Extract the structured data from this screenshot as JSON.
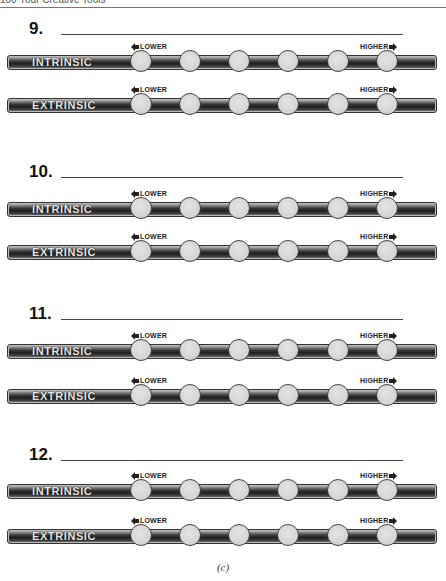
{
  "page": {
    "running_head": "100   Your Creative Tools",
    "caption": "(c)"
  },
  "scale_labels": {
    "lower": "LOWER",
    "higher": "HIGHER"
  },
  "items": [
    {
      "number": "9.",
      "scales": [
        {
          "label": "INTRINSIC",
          "points": 6
        },
        {
          "label": "EXTRINSIC",
          "points": 6
        }
      ]
    },
    {
      "number": "10.",
      "scales": [
        {
          "label": "INTRINSIC",
          "points": 6
        },
        {
          "label": "EXTRINSIC",
          "points": 6
        }
      ]
    },
    {
      "number": "11.",
      "scales": [
        {
          "label": "INTRINSIC",
          "points": 6
        },
        {
          "label": "EXTRINSIC",
          "points": 6
        }
      ]
    },
    {
      "number": "12.",
      "scales": [
        {
          "label": "INTRINSIC",
          "points": 6
        },
        {
          "label": "EXTRINSIC",
          "points": 6
        }
      ]
    }
  ]
}
